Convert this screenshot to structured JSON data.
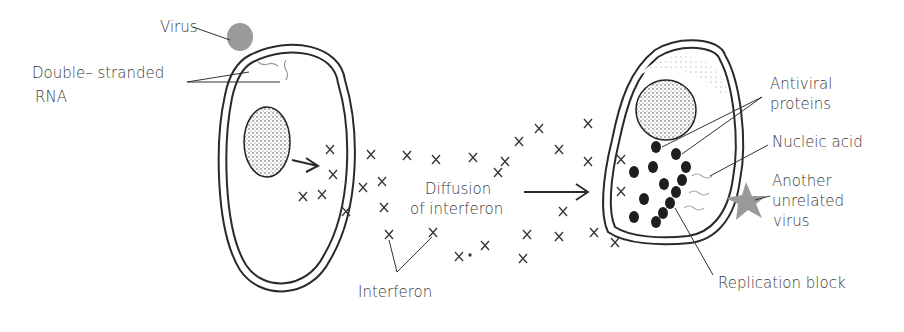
{
  "diagram": {
    "labels": {
      "virus": "Virus",
      "dsrna_line1": "Double– stranded",
      "dsrna_line2": "RNA",
      "diffusion_line1": "Diffusion",
      "diffusion_line2": "of interferon",
      "interferon": "Interferon",
      "antiviral_line1": "Antiviral",
      "antiviral_line2": "proteins",
      "nucleic_acid": "Nucleic acid",
      "another_line1": "Another",
      "another_line2": "unrelated",
      "another_line3": "virus",
      "replication_block": "Replication block"
    },
    "colors": {
      "ink": "#2a2a2a",
      "virus_fill": "#9a9a9a",
      "label_text": "#3a3a3a"
    }
  }
}
